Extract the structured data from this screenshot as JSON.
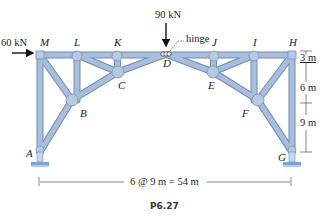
{
  "figure": {
    "caption": "P6.27",
    "colors": {
      "member": "#a9bedc",
      "member_edge": "#6f8cb5",
      "support": "#7fa3cc",
      "text": "#222222"
    },
    "loads": {
      "horizontal": "60 kN",
      "vertical": "90 kN"
    },
    "hinge_label": "hinge",
    "nodes": {
      "A": "A",
      "B": "B",
      "C": "C",
      "D": "D",
      "E": "E",
      "F": "F",
      "G": "G",
      "H": "H",
      "I": "I",
      "J": "J",
      "K": "K",
      "L": "L",
      "M": "M"
    },
    "dimensions": {
      "span": "6 @ 9 m = 54 m",
      "heights": [
        "3 m",
        "6 m",
        "9 m"
      ]
    }
  }
}
